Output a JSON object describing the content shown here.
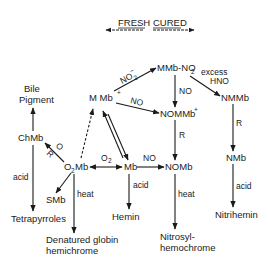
{
  "header": {
    "fresh_label": "FRESH",
    "cured_label": "CURED"
  },
  "nodes": {
    "mmb_plus": "M Mb",
    "mmb_no2": "MMb-NO",
    "nmmb": "NMMb",
    "nommb_plus": "NOMMb",
    "bile_pigment_1": "Bile",
    "bile_pigment_2": "Pigment",
    "chmb": "ChMb",
    "o2mb": "Mb",
    "mb": "Mb",
    "nomb": "NOMb",
    "nmb": "NMb",
    "smb": "SMb",
    "tetrapyrroles": "Tetrapyrroles",
    "hemin": "Hemin",
    "nitrihemin": "Nitrihemin",
    "denatured_1": "Denatured globin",
    "denatured_2": "hemichrome",
    "nitrosyl_1": "Nitrosyl-",
    "nitrosyl_2": "hemochrome"
  },
  "edge_labels": {
    "no2_minus": "NO",
    "no_mmb_to_nommb": "NO",
    "no_mmbno2_to_nommb": "NO",
    "excess": "excess",
    "hno": "HNO",
    "r_nommb_to_nomb": "R",
    "r_nmmb_to_nmb": "R",
    "o_chmb": "O",
    "r_chmb": "R",
    "o2": "O",
    "no_mb_to_nomb": "NO",
    "acid_chmb": "acid",
    "heat_o2mb": "heat",
    "acid_mb": "acid",
    "heat_nomb": "heat",
    "acid_nmb": "acid"
  }
}
